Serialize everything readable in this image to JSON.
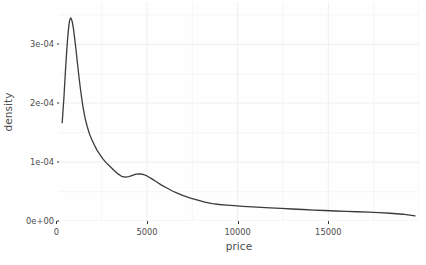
{
  "chart_data": {
    "type": "line",
    "title": "",
    "subtitle": "",
    "xlabel": "price",
    "ylabel": "density",
    "xlim": [
      150,
      20000
    ],
    "ylim": [
      0,
      0.000372
    ],
    "grid": true,
    "legend": null,
    "x_ticks": [
      0,
      5000,
      10000,
      15000
    ],
    "x_tick_labels": [
      "0",
      "5000",
      "10000",
      "15000"
    ],
    "y_ticks": [
      0,
      0.0001,
      0.0002,
      0.0003
    ],
    "y_tick_labels": [
      "0e+00",
      "1e-04",
      "2e-04",
      "3e-04"
    ],
    "series": [
      {
        "name": "density",
        "color": "#3b3b3b",
        "line_width": 1.3,
        "x": [
          326,
          420,
          500,
          570,
          630,
          690,
          740,
          790,
          840,
          890,
          950,
          1010,
          1080,
          1160,
          1250,
          1350,
          1460,
          1580,
          1700,
          1830,
          1960,
          2100,
          2250,
          2400,
          2560,
          2720,
          2880,
          3050,
          3220,
          3400,
          3600,
          3800,
          4000,
          4200,
          4400,
          4600,
          4800,
          5000,
          5250,
          5500,
          5800,
          6100,
          6400,
          6700,
          7000,
          7400,
          7800,
          8200,
          8600,
          9000,
          9400,
          9800,
          10300,
          10800,
          11300,
          11800,
          12400,
          13000,
          13600,
          14200,
          14800,
          15400,
          16000,
          16600,
          17200,
          17800,
          18400,
          19100,
          19780
        ],
        "y": [
          0.000167,
          0.000209,
          0.000252,
          0.000286,
          0.000312,
          0.000331,
          0.000341,
          0.000345,
          0.000343,
          0.000337,
          0.000326,
          0.000311,
          0.000293,
          0.00027,
          0.000245,
          0.00022,
          0.000196,
          0.000176,
          0.000161,
          0.000148,
          0.000138,
          0.000129,
          0.00012,
          0.000113,
          0.000106,
          0.0001,
          9.5e-05,
          9e-05,
          8.5e-05,
          8e-05,
          7.6e-05,
          7.45e-05,
          7.55e-05,
          7.75e-05,
          7.95e-05,
          8e-05,
          7.9e-05,
          7.65e-05,
          7.2e-05,
          6.7e-05,
          6.1e-05,
          5.6e-05,
          5.1e-05,
          4.7e-05,
          4.3e-05,
          3.9e-05,
          3.55e-05,
          3.2e-05,
          2.95e-05,
          2.8e-05,
          2.7e-05,
          2.62e-05,
          2.5e-05,
          2.4e-05,
          2.32e-05,
          2.24e-05,
          2.14e-05,
          2.04e-05,
          1.95e-05,
          1.86e-05,
          1.78e-05,
          1.7e-05,
          1.63e-05,
          1.57e-05,
          1.5e-05,
          1.42e-05,
          1.32e-05,
          1.15e-05,
          8.8e-06
        ]
      }
    ]
  },
  "theme": {
    "panel_background": "#fefefe",
    "grid_color": "#f0f0f0",
    "text_color": "#4d4d4d",
    "tick_color": "#333333",
    "curve_color": "#3b3b3b"
  }
}
